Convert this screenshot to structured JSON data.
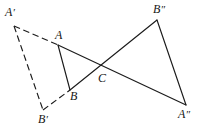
{
  "figure": {
    "background_color": "#ffffff",
    "stroke_color": "#1b1b1b",
    "width": 204,
    "height": 130,
    "points": {
      "A": {
        "label": "A",
        "prime": "",
        "x": 58,
        "y": 45,
        "label_x": 55,
        "label_y": 29
      },
      "B": {
        "label": "B",
        "prime": "",
        "x": 70,
        "y": 90,
        "label_x": 70,
        "label_y": 90
      },
      "C": {
        "label": "C",
        "prime": "",
        "x": 101,
        "y": 70,
        "label_x": 98,
        "label_y": 72
      },
      "A_prime": {
        "label": "A",
        "prime": "′",
        "x": 14,
        "y": 26,
        "label_x": 5,
        "label_y": 6
      },
      "B_prime": {
        "label": "B",
        "prime": "′",
        "x": 43,
        "y": 110,
        "label_x": 38,
        "label_y": 113
      },
      "B_dprime": {
        "label": "B",
        "prime": "″",
        "x": 157,
        "y": 20,
        "label_x": 153,
        "label_y": 3
      },
      "A_dprime": {
        "label": "A",
        "prime": "″",
        "x": 186,
        "y": 105,
        "label_x": 178,
        "label_y": 108
      }
    },
    "segments": [
      {
        "name": "segment-a-b",
        "from": "A",
        "to": "B",
        "style": "solid"
      },
      {
        "name": "segment-a-adprime",
        "from": "A",
        "to": "A_dprime",
        "style": "solid"
      },
      {
        "name": "segment-b-bdprime",
        "from": "B",
        "to": "B_dprime",
        "style": "solid"
      },
      {
        "name": "segment-bdprime-adprime",
        "from": "B_dprime",
        "to": "A_dprime",
        "style": "solid"
      },
      {
        "name": "segment-aprime-a",
        "from": "A_prime",
        "to": "A",
        "style": "dashed"
      },
      {
        "name": "segment-aprime-bprime",
        "from": "A_prime",
        "to": "B_prime",
        "style": "dashed"
      },
      {
        "name": "segment-bprime-b",
        "from": "B_prime",
        "to": "B",
        "style": "dashed"
      }
    ],
    "labels_order": [
      "A_prime",
      "A",
      "B",
      "C",
      "B_prime",
      "B_dprime",
      "A_dprime"
    ]
  }
}
